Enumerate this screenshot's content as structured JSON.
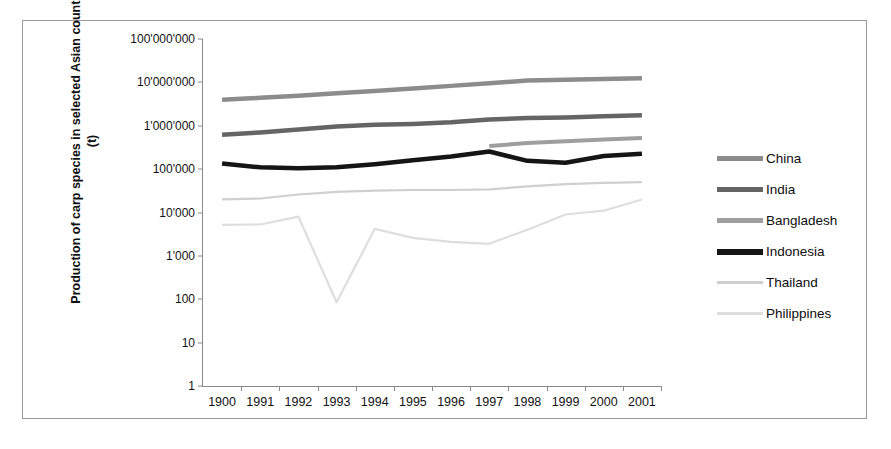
{
  "figure": {
    "ylabel": "Production of carp species in selected Asian countries (t)",
    "xlabel": "",
    "frame_color": "#9a9a9a",
    "axis_color": "#8a8a8a"
  },
  "legend": {
    "position": "right",
    "items": [
      {
        "label": "China",
        "color": "#8c8c8c",
        "swatch": "legend-swatch-china"
      },
      {
        "label": "India",
        "color": "#656565",
        "swatch": "legend-swatch-india"
      },
      {
        "label": "Bangladesh",
        "color": "#9e9e9e",
        "swatch": "legend-swatch-bangladesh"
      },
      {
        "label": "Indonesia",
        "color": "#151515",
        "swatch": "legend-swatch-indonesia"
      },
      {
        "label": "Thailand",
        "color": "#cfcfcf",
        "swatch": "legend-swatch-thailand"
      },
      {
        "label": "Philippines",
        "color": "#dedede",
        "swatch": "legend-swatch-philippines"
      }
    ]
  },
  "chart_data": {
    "type": "line",
    "title": "",
    "xlabel": "",
    "ylabel": "Production of carp species in selected Asian countries (t)",
    "yscale": "log",
    "ylim": [
      1,
      100000000
    ],
    "ytick_labels": [
      "100'000'000",
      "10'000'000",
      "1'000'000",
      "100'000",
      "10'000",
      "1'000",
      "100",
      "10",
      "1"
    ],
    "ytick_values": [
      100000000,
      10000000,
      1000000,
      100000,
      10000,
      1000,
      100,
      10,
      1
    ],
    "grid": false,
    "legend_position": "right",
    "categories": [
      "1900",
      "1991",
      "1992",
      "1993",
      "1994",
      "1995",
      "1996",
      "1997",
      "1998",
      "1999",
      "2000",
      "2001"
    ],
    "x": [
      1900,
      1991,
      1992,
      1993,
      1994,
      1995,
      1996,
      1997,
      1998,
      1999,
      2000,
      2001
    ],
    "series": [
      {
        "name": "China",
        "color": "#8c8c8c",
        "width": 4.5,
        "values": [
          4000000,
          4400000,
          4900000,
          5600000,
          6300000,
          7200000,
          8300000,
          9500000,
          11000000,
          11500000,
          12000000,
          12500000
        ]
      },
      {
        "name": "India",
        "color": "#656565",
        "width": 4.5,
        "values": [
          620000,
          700000,
          820000,
          960000,
          1050000,
          1100000,
          1200000,
          1400000,
          1500000,
          1550000,
          1650000,
          1750000
        ]
      },
      {
        "name": "Bangladesh",
        "color": "#9e9e9e",
        "width": 4,
        "values": [
          null,
          null,
          null,
          null,
          null,
          null,
          null,
          340000,
          400000,
          440000,
          480000,
          520000
        ]
      },
      {
        "name": "Indonesia",
        "color": "#151515",
        "width": 4.5,
        "values": [
          135000,
          110000,
          105000,
          110000,
          130000,
          160000,
          195000,
          255000,
          155000,
          140000,
          200000,
          225000
        ]
      },
      {
        "name": "Thailand",
        "color": "#cfcfcf",
        "width": 2.2,
        "values": [
          20000,
          21000,
          26000,
          30000,
          32000,
          33000,
          33000,
          34000,
          40000,
          45000,
          48000,
          50000
        ]
      },
      {
        "name": "Philippines",
        "color": "#dedede",
        "width": 2.2,
        "values": [
          5200,
          5300,
          8000,
          85,
          4200,
          2600,
          2100,
          1900,
          4000,
          9000,
          11000,
          20000
        ]
      }
    ]
  },
  "caption": ""
}
